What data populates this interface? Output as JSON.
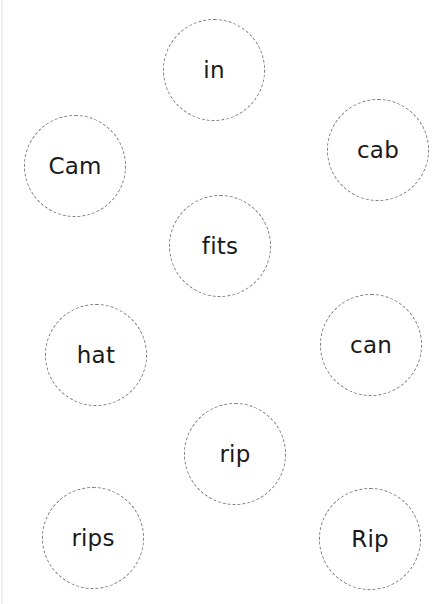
{
  "worksheet": {
    "circle_border_color": "#7a7a7a",
    "text_color": "#1a1a1a",
    "words": [
      {
        "id": "in",
        "label": "in",
        "cx": 214,
        "cy": 70
      },
      {
        "id": "cam",
        "label": "Cam",
        "cx": 75,
        "cy": 166
      },
      {
        "id": "cab",
        "label": "cab",
        "cx": 378,
        "cy": 150
      },
      {
        "id": "fits",
        "label": "fits",
        "cx": 220,
        "cy": 246
      },
      {
        "id": "hat",
        "label": "hat",
        "cx": 96,
        "cy": 355
      },
      {
        "id": "can",
        "label": "can",
        "cx": 371,
        "cy": 345
      },
      {
        "id": "rip",
        "label": "rip",
        "cx": 235,
        "cy": 454
      },
      {
        "id": "rips",
        "label": "rips",
        "cx": 93,
        "cy": 538
      },
      {
        "id": "rip-capital",
        "label": "Rip",
        "cx": 370,
        "cy": 539
      }
    ]
  }
}
